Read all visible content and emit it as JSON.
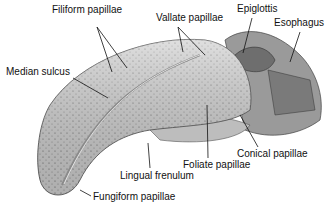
{
  "figure": {
    "labels": [
      {
        "id": "filiform",
        "text": "Filiform papillae",
        "x": 52,
        "y": 10
      },
      {
        "id": "vallate",
        "text": "Vallate papillae",
        "x": 156,
        "y": 18
      },
      {
        "id": "epiglottis",
        "text": "Epiglottis",
        "x": 237,
        "y": 8
      },
      {
        "id": "esophagus",
        "text": "Esophagus",
        "x": 274,
        "y": 22
      },
      {
        "id": "median_sulcus",
        "text": "Median sulcus",
        "x": 6,
        "y": 70
      },
      {
        "id": "conical",
        "text": "Conical papillae",
        "x": 237,
        "y": 150
      },
      {
        "id": "foliate",
        "text": "Foliate papillae",
        "x": 183,
        "y": 162
      },
      {
        "id": "lingual_frenulum",
        "text": "Lingual frenulum",
        "x": 120,
        "y": 172
      },
      {
        "id": "fungiform",
        "text": "Fungiform papillae",
        "x": 93,
        "y": 191
      }
    ]
  }
}
